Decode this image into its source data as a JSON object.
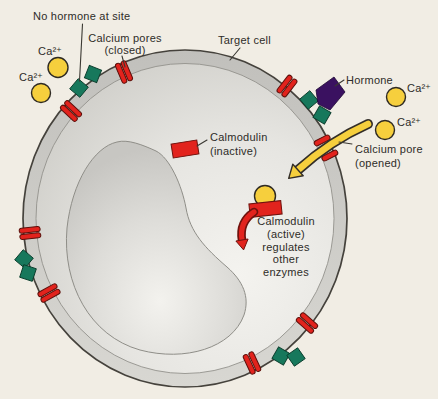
{
  "labels": {
    "no_hormone_site": "No hormone at site",
    "calcium_pores_closed_1": "Calcium pores",
    "calcium_pores_closed_2": "(closed)",
    "target_cell": "Target cell",
    "hormone": "Hormone",
    "calcium_ion": "Ca²⁺",
    "calmodulin_inactive_1": "Calmodulin",
    "calmodulin_inactive_2": "(inactive)",
    "calcium_pore_opened_1": "Calcium pore",
    "calcium_pore_opened_2": "(opened)",
    "calmodulin_active_1": "Calmodulin",
    "calmodulin_active_2": "(active)",
    "calmodulin_active_3": "regulates",
    "calmodulin_active_4": "other",
    "calmodulin_active_5": "enzymes"
  },
  "colors": {
    "background": "#f1ede4",
    "membrane_ring": "#c9c8c4",
    "cytoplasm": "#e4e3df",
    "nucleus": "#dcdbd7",
    "pore_red": "#e2231d",
    "receptor_green": "#17785c",
    "hormone_purple": "#3a1160",
    "calcium_yellow": "#f6cf3d",
    "text": "#2e2c28",
    "outline": "#45423c"
  }
}
